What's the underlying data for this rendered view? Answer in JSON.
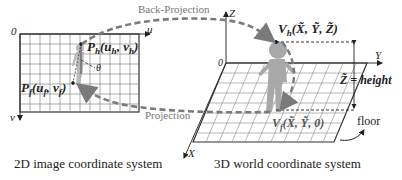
{
  "left_panel": {
    "origin_label": "0",
    "u_axis_label": "u",
    "v_axis_label": "v",
    "head_point": {
      "name": "P",
      "sub": "h",
      "coords": "(u",
      "coords_sub": "h",
      "coords_tail": ", v",
      "coords_tail_sub": "h",
      "close": ")"
    },
    "foot_point": {
      "name": "P",
      "sub": "f",
      "coords": "(u",
      "coords_sub": "f",
      "coords_tail": ", v",
      "coords_tail_sub": "f",
      "close": ")"
    },
    "angle_label": "θ",
    "caption": "2D image coordinate system"
  },
  "right_panel": {
    "origin_label": "0",
    "x_axis_label": "X",
    "y_axis_label": "Y",
    "z_axis_label": "Z",
    "head_point": {
      "name": "V",
      "sub": "h",
      "coords": "(X̃, Ỹ, Z̃)"
    },
    "foot_point": {
      "name": "V",
      "sub": "f",
      "coords": "(X̃, Ỹ, 0)"
    },
    "height_label": "Z̃ = height",
    "floor_label": "floor",
    "caption": "3D world coordinate system"
  },
  "arrows": {
    "back_projection": "Back-Projection",
    "projection": "Projection"
  },
  "colors": {
    "grid": "#444444",
    "dashed_arrow": "#808080",
    "figure": "#a8a8a8",
    "text": "#222222"
  }
}
